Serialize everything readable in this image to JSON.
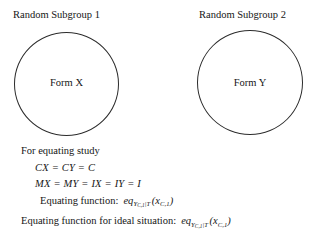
{
  "diagram": {
    "type": "random-groups-equating-design",
    "groups": [
      {
        "label": "Random Subgroup 1",
        "form_label": "Form X",
        "shape": "circle"
      },
      {
        "label": "Random Subgroup 2",
        "form_label": "Form Y",
        "shape": "circle"
      }
    ]
  },
  "equations": {
    "heading": "For equating study",
    "line_conditions": "CX = CY = C",
    "line_measurement": "MX = MY = IX = IY = I",
    "equating_function": {
      "prefix": "Equating function:",
      "fn": "eq",
      "sub_base": "Y",
      "sub_sub": "C,1",
      "sub_bar": "|",
      "sub_cond": "T",
      "arg_open": "(",
      "arg_base": "x",
      "arg_sub": "C,1",
      "arg_close": ")"
    },
    "ideal_function": {
      "prefix": "Equating function for ideal situation:",
      "fn": "eq",
      "sub_base": "Y",
      "sub_sub": "C,1",
      "sub_bar": "|",
      "sub_cond": "T",
      "arg_open": "(",
      "arg_base": "x",
      "arg_sub": "C,1",
      "arg_close": ")"
    }
  },
  "colors": {
    "background": "#ffffff",
    "text": "#161616",
    "stroke": "#2b2b2b"
  }
}
